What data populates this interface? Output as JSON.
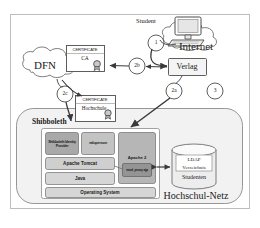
{
  "figure": {
    "frame_color": "#b9b9b9",
    "background": "#ffffff",
    "line_color": "#5a5a5a",
    "text_color": "#1b1b1b"
  },
  "external": {
    "student_label": "Student",
    "computer_icon": "desktop-computer-icon",
    "internet_cloud": "Internet",
    "dfn_cloud": "DFN",
    "verlag_box": "Verlag"
  },
  "certificates": [
    {
      "id": "ca",
      "header": "CERTIFICATE",
      "subject": "CA",
      "seal_icon": "certificate-seal-icon"
    },
    {
      "id": "hochschule",
      "header": "CERTIFICATE",
      "subject": "Hochschule",
      "seal_icon": "certificate-seal-icon"
    }
  ],
  "steps": [
    {
      "id": "1",
      "label": "1"
    },
    {
      "id": "2b",
      "label": "2b"
    },
    {
      "id": "2a",
      "label": "2a"
    },
    {
      "id": "2c",
      "label": "2c"
    },
    {
      "id": "3",
      "label": "3"
    }
  ],
  "network": {
    "zone_label": "Hochschul-Netz",
    "server_label": "Shibboleth",
    "stack": {
      "row1": [
        {
          "id": "idp",
          "label": "Shibboleth Identity Provider",
          "fill": "#a9a9a9"
        },
        {
          "id": "edugates",
          "label": "eduperson",
          "fill": "#c3c3c3"
        }
      ],
      "row2": [
        {
          "id": "tomcat",
          "label": "Apache Tomcat",
          "fill": "#cfcfcf"
        }
      ],
      "row3": [
        {
          "id": "java",
          "label": "Java",
          "fill": "#d6d6d6"
        }
      ],
      "row4": [
        {
          "id": "os",
          "label": "Operating System",
          "fill": "#d6d6d6"
        }
      ],
      "apache": {
        "label": "Apache 2",
        "fill": "#b6b6b6",
        "module": {
          "label": "mod_proxy ajp",
          "fill": "#949494"
        }
      }
    },
    "directory": {
      "icon": "database-cylinder-icon",
      "title_line1": "LDAP",
      "title_line2": "Verzeichnis",
      "caption": "Studenten"
    }
  }
}
